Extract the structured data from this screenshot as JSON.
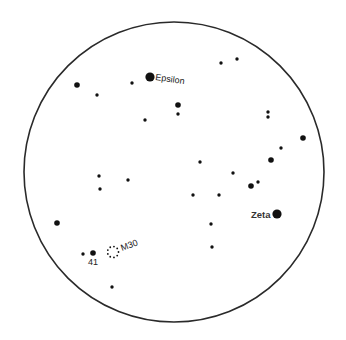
{
  "diagram": {
    "type": "star-finder-chart",
    "field": {
      "shape": "circle",
      "color": "#2a2a2a"
    },
    "colors": {
      "background": "#ffffff",
      "stars": "#111111",
      "labels": "#222222"
    },
    "stars": [
      {
        "name": "",
        "size": "medium",
        "x": 77,
        "y": 85
      },
      {
        "name": "",
        "size": "small",
        "x": 97,
        "y": 95
      },
      {
        "name": "",
        "size": "small",
        "x": 132,
        "y": 83
      },
      {
        "name": "Epsilon",
        "size": "large",
        "x": 150,
        "y": 77,
        "label": "Epsilon"
      },
      {
        "name": "",
        "size": "small",
        "x": 221,
        "y": 63
      },
      {
        "name": "",
        "size": "small",
        "x": 237,
        "y": 59
      },
      {
        "name": "",
        "size": "small",
        "x": 145,
        "y": 120
      },
      {
        "name": "",
        "size": "medium",
        "x": 178,
        "y": 105
      },
      {
        "name": "",
        "size": "small",
        "x": 178,
        "y": 114
      },
      {
        "name": "",
        "size": "small",
        "x": 268,
        "y": 112
      },
      {
        "name": "",
        "size": "small",
        "x": 268,
        "y": 117
      },
      {
        "name": "",
        "size": "medium",
        "x": 303,
        "y": 138
      },
      {
        "name": "",
        "size": "small",
        "x": 281,
        "y": 148
      },
      {
        "name": "",
        "size": "medium",
        "x": 271,
        "y": 160
      },
      {
        "name": "",
        "size": "small",
        "x": 200,
        "y": 162
      },
      {
        "name": "",
        "size": "small",
        "x": 233,
        "y": 173
      },
      {
        "name": "",
        "size": "small",
        "x": 258,
        "y": 182
      },
      {
        "name": "",
        "size": "medium",
        "x": 251,
        "y": 186
      },
      {
        "name": "",
        "size": "small",
        "x": 99,
        "y": 176
      },
      {
        "name": "",
        "size": "small",
        "x": 128,
        "y": 180
      },
      {
        "name": "",
        "size": "small",
        "x": 100,
        "y": 189
      },
      {
        "name": "",
        "size": "small",
        "x": 193,
        "y": 195
      },
      {
        "name": "",
        "size": "small",
        "x": 219,
        "y": 195
      },
      {
        "name": "Zeta",
        "size": "large",
        "x": 277,
        "y": 214,
        "label": "Zeta"
      },
      {
        "name": "",
        "size": "small",
        "x": 211,
        "y": 224
      },
      {
        "name": "",
        "size": "small",
        "x": 212,
        "y": 247
      },
      {
        "name": "",
        "size": "medium",
        "x": 57,
        "y": 223
      },
      {
        "name": "",
        "size": "small",
        "x": 83,
        "y": 254
      },
      {
        "name": "41",
        "size": "medium",
        "x": 93,
        "y": 253,
        "label": "41"
      },
      {
        "name": "",
        "size": "small",
        "x": 112,
        "y": 287
      }
    ],
    "deep_sky_objects": [
      {
        "name": "M30",
        "type": "globular-cluster",
        "label": "M30",
        "x": 113,
        "y": 252
      }
    ]
  }
}
